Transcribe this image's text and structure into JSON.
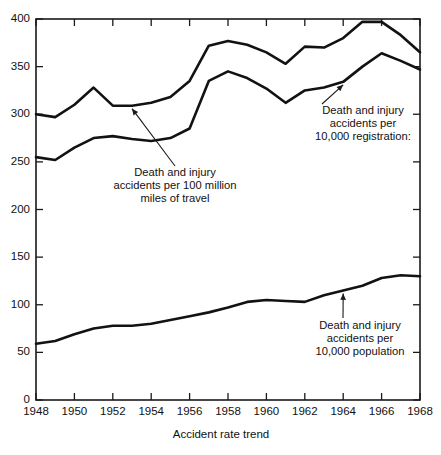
{
  "figure": {
    "ghost_fragment": "",
    "axis_title": "Accident rate trend"
  },
  "chart_data": {
    "type": "line",
    "title": "",
    "subtitle": "",
    "xlabel": "Accident rate trend",
    "ylabel": "",
    "xlim": [
      1948,
      1968
    ],
    "ylim": [
      0,
      400
    ],
    "grid": false,
    "legend_position": "inline-annotations",
    "x_ticks": [
      "1948",
      "1950",
      "1952",
      "1954",
      "1956",
      "1958",
      "1960",
      "1962",
      "1964",
      "1966",
      "1968"
    ],
    "y_ticks": [
      "0",
      "50",
      "100",
      "150",
      "200",
      "250",
      "300",
      "350",
      "400"
    ],
    "x": [
      1948,
      1949,
      1950,
      1951,
      1952,
      1953,
      1954,
      1955,
      1956,
      1957,
      1958,
      1959,
      1960,
      1961,
      1962,
      1963,
      1964,
      1965,
      1966,
      1967,
      1968
    ],
    "series": [
      {
        "name": "Death and injury accidents per 100 million miles of travel",
        "values": [
          300,
          297,
          310,
          328,
          309,
          309,
          312,
          318,
          335,
          372,
          377,
          373,
          365,
          353,
          371,
          370,
          380,
          397,
          397,
          383,
          365
        ]
      },
      {
        "name": "Death and injury accidents per 10,000 registration:",
        "values": [
          255,
          252,
          265,
          275,
          277,
          274,
          272,
          275,
          285,
          335,
          345,
          338,
          327,
          312,
          325,
          328,
          334,
          350,
          364,
          356,
          347
        ]
      },
      {
        "name": "Death and injury accidents per 10,000 population",
        "values": [
          59,
          62,
          69,
          75,
          78,
          78,
          80,
          84,
          88,
          92,
          97,
          103,
          105,
          104,
          103,
          110,
          115,
          120,
          128,
          131,
          130
        ]
      }
    ],
    "annotations": [
      {
        "id": "annot-miles",
        "text": "Death and injury\naccidents per 100 million\nmiles of travel",
        "target_year": 1953,
        "target_value": 309
      },
      {
        "id": "annot-registrations",
        "text": "Death and injury\naccidents per\n10,000 registration:",
        "target_year": 1964,
        "target_value": 334
      },
      {
        "id": "annot-population",
        "text": "Death and injury\naccidents per\n10,000 population",
        "target_year": 1964,
        "target_value": 115
      }
    ]
  }
}
